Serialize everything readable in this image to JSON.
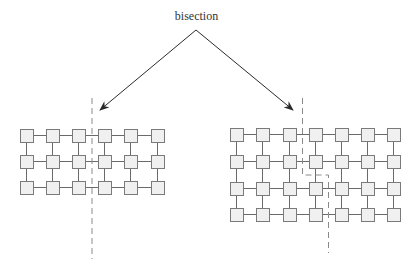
{
  "title": "bisection",
  "colors": {
    "node_fill": "#f0f0f0",
    "node_stroke": "#7a7a7a",
    "edge": "#6a6a6a",
    "cut": "#8a8a8a",
    "arrow": "#2a2a2a"
  },
  "meshes": [
    {
      "name": "left-mesh",
      "cols": 6,
      "rows": 3,
      "x": [
        20,
        46,
        72,
        98,
        124,
        151
      ],
      "y": [
        129,
        155,
        181
      ],
      "node_size": 13,
      "cut_path": "M92 98 L92 259"
    },
    {
      "name": "right-mesh",
      "cols": 7,
      "rows": 4,
      "x": [
        230,
        256,
        283,
        309,
        335,
        361,
        387
      ],
      "y": [
        128,
        155,
        182,
        208
      ],
      "node_size": 13,
      "cut_path": "M302.5 98 L302.5 175 L328.5 175 L328.5 253"
    }
  ],
  "arrows": [
    {
      "name": "arrow-left",
      "from": [
        196,
        30
      ],
      "to": [
        100,
        110
      ]
    },
    {
      "name": "arrow-right",
      "from": [
        196,
        30
      ],
      "to": [
        293,
        110
      ]
    }
  ]
}
